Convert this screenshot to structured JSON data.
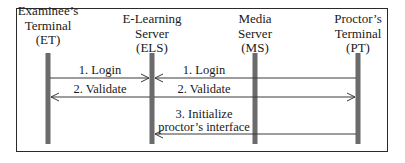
{
  "diagram": {
    "type": "sequence",
    "actors": [
      {
        "id": "ET",
        "line1": "Examinee’s",
        "line2": "Terminal",
        "line3": "(ET)",
        "x": 48
      },
      {
        "id": "ELS",
        "line1": "E-Learning",
        "line2": "Server",
        "line3": "(ELS)",
        "x": 152
      },
      {
        "id": "MS",
        "line1": "Media",
        "line2": "Server",
        "line3": "(MS)",
        "x": 255
      },
      {
        "id": "PT",
        "line1": "Proctor’s",
        "line2": "Terminal",
        "line3": "(PT)",
        "x": 358
      }
    ],
    "messages": [
      {
        "label": "1. Login",
        "from": "ET",
        "to": "ELS"
      },
      {
        "label": "1. Login",
        "from": "PT",
        "to": "ELS"
      },
      {
        "label": "2. Validate",
        "from": "ELS",
        "to": "ET"
      },
      {
        "label": "2. Validate",
        "from": "ELS",
        "to": "PT"
      },
      {
        "label_line1": "3. Initialize",
        "label_line2": "proctor’s interface",
        "from": "PT",
        "to": "ELS"
      }
    ],
    "colors": {
      "lifeline": "#6b6b6b",
      "arrow": "#3a3a3a",
      "border": "#2a2a2a"
    }
  }
}
